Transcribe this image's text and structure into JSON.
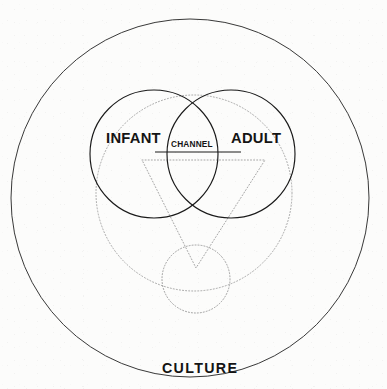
{
  "diagram": {
    "background_color": "#fcfcfb",
    "stroke_color": "#1a1a1a",
    "dotted_color": "#9a9a9a",
    "labels": {
      "infant": "INFANT",
      "adult": "ADULT",
      "channel": "CHANNEL",
      "culture": "CULTURE"
    },
    "shapes": [
      {
        "name": "outer-culture-circle",
        "type": "circle",
        "style": "solid",
        "cx": 190,
        "cy": 198,
        "r": 179
      },
      {
        "name": "infant-circle",
        "type": "circle",
        "style": "solid",
        "cx": 154,
        "cy": 154,
        "r": 64
      },
      {
        "name": "adult-circle",
        "type": "circle",
        "style": "solid",
        "cx": 231,
        "cy": 154,
        "r": 64
      },
      {
        "name": "large-dotted-circle",
        "type": "circle",
        "style": "dotted",
        "cx": 194,
        "cy": 193,
        "r": 98
      },
      {
        "name": "small-dotted-circle",
        "type": "circle",
        "style": "dotted",
        "cx": 196,
        "cy": 279,
        "r": 34
      },
      {
        "name": "dotted-triangle",
        "type": "triangle",
        "style": "dotted",
        "points": "142,160 265,160 196,268"
      },
      {
        "name": "channel-underline",
        "type": "line",
        "style": "solid",
        "x1": 155,
        "y1": 152,
        "x2": 241,
        "y2": 152
      }
    ]
  }
}
